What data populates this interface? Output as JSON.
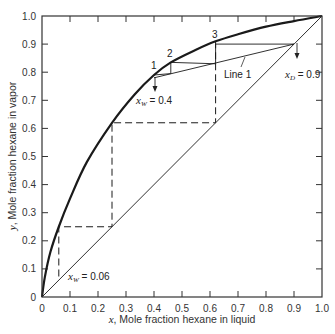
{
  "chart_data": {
    "type": "line",
    "title": "",
    "xlabel_var": "x",
    "xlabel": ", Mole fraction hexane in liquid",
    "ylabel_var": "y",
    "ylabel": ", Mole fraction hexane in vapor",
    "xlim": [
      0,
      1.0
    ],
    "ylim": [
      0,
      1.0
    ],
    "grid": false,
    "x_ticks": [
      "0",
      "0.1",
      "0.2",
      "0.3",
      "0.4",
      "0.5",
      "0.6",
      "0.7",
      "0.8",
      "0.9",
      "1.0"
    ],
    "y_ticks": [
      "0",
      "0.1",
      "0.2",
      "0.3",
      "0.4",
      "0.5",
      "0.6",
      "0.7",
      "0.8",
      "0.9",
      "1.0"
    ],
    "series": [
      {
        "name": "Equilibrium curve",
        "style": "thick-solid",
        "x": [
          0,
          0.01,
          0.03,
          0.06,
          0.1,
          0.16,
          0.25,
          0.33,
          0.4,
          0.46,
          0.55,
          0.62,
          0.7,
          0.8,
          0.9,
          1.0
        ],
        "y": [
          0,
          0.07,
          0.16,
          0.25,
          0.35,
          0.48,
          0.62,
          0.72,
          0.79,
          0.835,
          0.88,
          0.91,
          0.935,
          0.962,
          0.982,
          1.0
        ]
      },
      {
        "name": "Diagonal y = x",
        "style": "thin-solid",
        "x": [
          0,
          1.0
        ],
        "y": [
          0,
          1.0
        ]
      },
      {
        "name": "Line 1",
        "style": "thin-solid",
        "x": [
          0.4,
          0.9
        ],
        "y": [
          0.78,
          0.9
        ]
      },
      {
        "name": "Solid stages",
        "style": "thin-solid",
        "x": [
          0.9,
          0.62,
          0.62,
          0.46,
          0.46,
          0.4
        ],
        "y": [
          0.9,
          0.9,
          0.83,
          0.835,
          0.795,
          0.79
        ]
      },
      {
        "name": "Dashed stages",
        "style": "dashed",
        "x": [
          0.62,
          0.62,
          0.25,
          0.25,
          0.25,
          0.06,
          0.06
        ],
        "y": [
          0.91,
          0.62,
          0.62,
          0.25,
          0.25,
          0.25,
          0.06
        ]
      }
    ],
    "annotations": {
      "stage_1": "1",
      "stage_2": "2",
      "stage_3": "3",
      "line_1": "Line 1",
      "xw_upper_var": "x",
      "xw_upper_sub": "W",
      "xw_upper_value": " = 0.4",
      "xd_var": "x",
      "xd_sub": "D",
      "xd_value": " = 0.9",
      "xw_lower_var": "x",
      "xw_lower_sub": "W",
      "xw_lower_value": " = 0.06"
    }
  }
}
